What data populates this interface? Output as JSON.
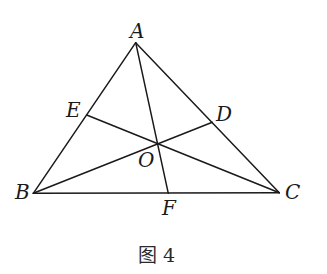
{
  "diagram": {
    "type": "triangle-cevians",
    "points": {
      "A": {
        "label": "A",
        "x": 135.7,
        "y": 42.7,
        "lx": 130,
        "ly": 38
      },
      "B": {
        "label": "B",
        "x": 33.3,
        "y": 193.3,
        "lx": 15,
        "ly": 199
      },
      "C": {
        "label": "C",
        "x": 279.3,
        "y": 192.7,
        "lx": 285,
        "ly": 199
      },
      "D": {
        "label": "D",
        "x": 212.3,
        "y": 122.3,
        "lx": 216,
        "ly": 121
      },
      "E": {
        "label": "E",
        "x": 86.7,
        "y": 115.0,
        "lx": 66,
        "ly": 117
      },
      "F": {
        "label": "F",
        "x": 168.3,
        "y": 193.3,
        "lx": 162,
        "ly": 215
      },
      "O": {
        "label": "O",
        "x": 157.7,
        "y": 144.0,
        "lx": 138,
        "ly": 167
      }
    },
    "segments": [
      {
        "from": "A",
        "to": "B"
      },
      {
        "from": "B",
        "to": "C"
      },
      {
        "from": "C",
        "to": "A"
      },
      {
        "from": "A",
        "to": "F"
      },
      {
        "from": "B",
        "to": "D"
      },
      {
        "from": "C",
        "to": "E"
      }
    ],
    "caption": "图 4"
  }
}
